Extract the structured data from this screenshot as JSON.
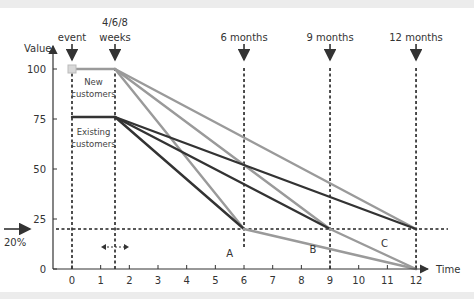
{
  "chart_data": {
    "type": "line",
    "title": "",
    "xlabel": "Time",
    "ylabel": "Value",
    "xlim": [
      -0.5,
      12.6
    ],
    "ylim": [
      0,
      100
    ],
    "x_ticks": [
      0,
      1,
      2,
      3,
      4,
      5,
      6,
      7,
      8,
      9,
      10,
      11,
      12
    ],
    "y_ticks": [
      0,
      25,
      50,
      75,
      100
    ],
    "y_tick_labels": [
      "0",
      "25",
      "50",
      "75",
      "100"
    ],
    "grid": false,
    "legend": null,
    "threshold": {
      "label": "20%",
      "value": 20
    },
    "markers_top": [
      {
        "label": "event",
        "x": 0
      },
      {
        "label": "4/6/8 weeks",
        "x": 1.5
      },
      {
        "label": "6 months",
        "x": 6
      },
      {
        "label": "9 months",
        "x": 9
      },
      {
        "label": "12 months",
        "x": 12
      }
    ],
    "group_labels": [
      {
        "text": "New customers",
        "x": 0.75,
        "y": 92
      },
      {
        "text": "Existing customers",
        "x": 0.75,
        "y": 67
      }
    ],
    "region_labels": [
      {
        "text": "A",
        "x": 5.5,
        "y": 6
      },
      {
        "text": "B",
        "x": 8.4,
        "y": 8
      },
      {
        "text": "C",
        "x": 10.9,
        "y": 11
      }
    ],
    "series": [
      {
        "name": "New customers plateau",
        "color": "#9a9a9a",
        "points": [
          [
            0,
            100
          ],
          [
            1.5,
            100
          ]
        ]
      },
      {
        "name": "New → 6 months",
        "color": "#9a9a9a",
        "points": [
          [
            1.5,
            100
          ],
          [
            6,
            20
          ]
        ]
      },
      {
        "name": "New → 9 months",
        "color": "#9a9a9a",
        "points": [
          [
            1.5,
            100
          ],
          [
            9,
            20
          ]
        ]
      },
      {
        "name": "New → 12 months",
        "color": "#9a9a9a",
        "points": [
          [
            1.5,
            100
          ],
          [
            12,
            20
          ]
        ]
      },
      {
        "name": "Existing customers plateau",
        "color": "#333333",
        "points": [
          [
            0,
            76
          ],
          [
            1.5,
            76
          ]
        ]
      },
      {
        "name": "Existing → 6 months",
        "color": "#333333",
        "points": [
          [
            1.5,
            76
          ],
          [
            6,
            20
          ]
        ]
      },
      {
        "name": "Existing → 9 months",
        "color": "#333333",
        "points": [
          [
            1.5,
            76
          ],
          [
            9,
            20
          ]
        ]
      },
      {
        "name": "Existing → 12 months",
        "color": "#333333",
        "points": [
          [
            1.5,
            76
          ],
          [
            12,
            20
          ]
        ]
      },
      {
        "name": "A: 6 months → 0 at 12",
        "color": "#9a9a9a",
        "points": [
          [
            6,
            20
          ],
          [
            12,
            0
          ]
        ]
      },
      {
        "name": "B/C: 9 months → 0 at 12",
        "color": "#9a9a9a",
        "points": [
          [
            9,
            20
          ],
          [
            12,
            0
          ]
        ]
      }
    ]
  },
  "axis": {
    "x_label": "Time",
    "y_label": "Value",
    "threshold_label": "20%"
  }
}
